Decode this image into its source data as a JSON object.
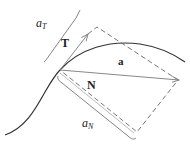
{
  "diagram": {
    "labels": {
      "tangent_vector": "T",
      "normal_vector": "N",
      "acceleration_vector": "a",
      "tangential_component_base": "a",
      "tangential_component_sub": "T",
      "normal_component_base": "a",
      "normal_component_sub": "N"
    },
    "colors": {
      "curve": "#333333",
      "vectors": "#888888",
      "dashed": "#666666",
      "brackets": "#777777",
      "text": "#222222"
    }
  }
}
